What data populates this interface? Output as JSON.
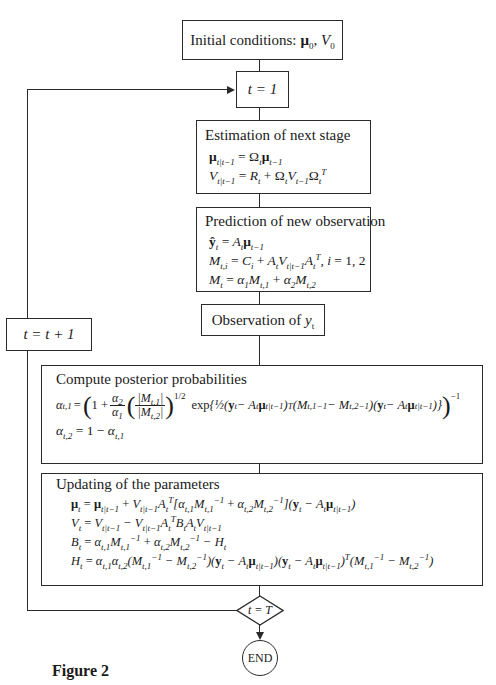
{
  "figure_caption": "Figure 2",
  "nodes": {
    "initial": {
      "label": "Initial conditions:",
      "vars": "μ₀, V₀"
    },
    "t_init": {
      "label": "t = 1"
    },
    "estimation": {
      "title": "Estimation of next stage",
      "equations": [
        "μ_{t|t−1} = Ω_t μ_{t−1}",
        "V_{t|t−1} = R_t + Ω_t V_{t−1} Ω_t^T"
      ]
    },
    "prediction": {
      "title": "Prediction of new observation",
      "equations": [
        "ŷ_t = A_t μ_{t−1}",
        "M_{t,i} = C_i + A_t V_{t|t−1} A_t^T, i = 1, 2",
        "M_t = α₁ M_{t,1} + α₂ M_{t,2}"
      ]
    },
    "increment": {
      "label": "t = t + 1"
    },
    "observation": {
      "label": "Observation of y_t"
    },
    "posterior": {
      "title": "Compute posterior probabilities",
      "equations": [
        "α_{t,1} = (1 + (α₂/α₁)(|M_{t,1}|/|M_{t,2}|)^{1/2} exp{½(y_t − A_t μ_{t|t−1})^T (M_{t,1}^{−1} − M_{t,2}^{−1})(y_t − A_t μ_{t|t−1})})^{−1}",
        "α_{t,2} = 1 − α_{t,1}"
      ]
    },
    "update": {
      "title": "Updating of the parameters",
      "equations": [
        "μ_t = μ_{t|t−1} + V_{t|t−1} A_t^T [α_{t,1} M_{t,1}^{−1} + α_{t,2} M_{t,2}^{−1}](y_t − A_t μ_{t|t−1})",
        "V_t = V_{t|t−1} − V_{t|t−1} A_t^T B_t A_t V_{t|t−1}",
        "B_t = α_{t,1} M_{t,1}^{−1} + α_{t,2} M_{t,2}^{−1} − H_t",
        "H_t = α_{t,1} α_{t,2} (M_{t,1}^{−1} − M_{t,2}^{−1})(y_t − A_t μ_{t|t−1})(y_t − A_t μ_{t|t−1})^T (M_{t,1}^{−1} − M_{t,2}^{−1})"
      ]
    },
    "decision": {
      "label": "t = T"
    },
    "end": {
      "label": "END"
    }
  },
  "edges": [
    [
      "initial",
      "t_init"
    ],
    [
      "t_init",
      "estimation"
    ],
    [
      "estimation",
      "prediction"
    ],
    [
      "prediction",
      "observation"
    ],
    [
      "observation",
      "posterior"
    ],
    [
      "posterior",
      "update"
    ],
    [
      "update",
      "decision"
    ],
    [
      "decision",
      "end",
      "yes"
    ],
    [
      "decision",
      "increment",
      "no (loop back)"
    ],
    [
      "increment",
      "t_init"
    ]
  ]
}
